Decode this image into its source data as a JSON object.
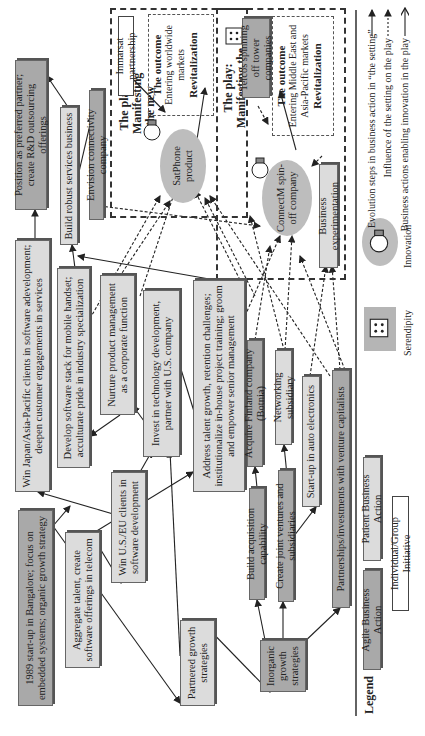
{
  "orientation": "rotated-90-ccw",
  "nodes": {
    "start": "1989 start-up in Bangalore; focus on embedded systems; organic growth strategy",
    "aggregate": "Aggregate talent, create software offerings in telecom",
    "win_us_eu": "Win U.S./EU clients in software development",
    "win_japan": "Win Japan/Asia-Pacific clients in software adevelopment; deepen customer engagements in services",
    "develop_stack": "Develop software stack for mobile handset; acculturate pride in industry specialization",
    "nurture": "Nurture product management as a corporate function",
    "invest_tech": "Invest in technology development, partner with U.S. company",
    "address_talent": "Address talent growth, retention challenges; institutionalize in-house project training; groom and empower senior management",
    "build_services": "Build robust services business",
    "position_partner": "Position as preferred partner; create R&D outsourcing offerings",
    "envision": "Envision connectivity company",
    "partnered": "Partnered growth strategies",
    "inorganic": "Inorganic growth strategies",
    "build_acq": "Build acquisition capability",
    "joint_ventures": "Create joint ventures and subsidiaries",
    "partnerships_vc": "Partnerships/investments with venture capitalists",
    "acquire_finland": "Acquire Finland company (Botnia)",
    "networking": "Networking subsidiary",
    "auto_electronics": "Start-up in auto electronics",
    "business_exp": "Business experimentation",
    "inmarsat": "Inmarsat partnership",
    "telcos": "Telcos spinning off tower companies"
  },
  "plays": [
    {
      "title": "The play: Manifesting the new",
      "innovation": "SatPhone product",
      "outcome_title": "The outcome",
      "outcome_text": "Entering worldwide markets",
      "outcome_result": "Revitalization"
    },
    {
      "title": "The play: Manifesting the new",
      "innovation": "ConnectM spin-off company",
      "outcome_title": "The outcome",
      "outcome_text": "Entering Middle East and Asia-Pacific markets",
      "outcome_result": "Revitalization"
    }
  ],
  "legend": {
    "title": "Legend",
    "agile": "Agile Business Action",
    "patient": "Patient Business Action",
    "individual": "Individual/Group Initiative",
    "serendipity": "Serendipity",
    "innovation": "Innovation",
    "arrows": [
      "Evolution steps in business action in “the setting”",
      "Influence of the setting on the play",
      "Business actions enabling innovation in the play"
    ]
  },
  "colors": {
    "patient": "#dcdcdc",
    "agile": "#a9a9a9",
    "innovation": "#bdbdbd"
  }
}
